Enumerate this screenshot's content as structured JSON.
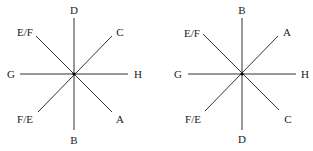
{
  "diagrams": [
    {
      "id": "left",
      "center": [
        74,
        74
      ],
      "labels": {
        "top": "D",
        "top_right": "C",
        "right": "H",
        "bottom_right": "A",
        "bottom": "B",
        "bottom_left": "F/E",
        "left": "G",
        "top_left": "E/F"
      }
    },
    {
      "id": "right",
      "center": [
        85,
        74
      ],
      "labels": {
        "top": "B",
        "top_right": "A",
        "right": "H",
        "bottom_right": "C",
        "bottom": "D",
        "bottom_left": "F/E",
        "left": "G",
        "top_left": "E/F"
      }
    }
  ],
  "style": {
    "line_color": "#333333",
    "center_dot_color": "#000000"
  }
}
